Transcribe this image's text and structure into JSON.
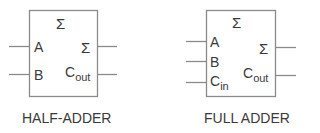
{
  "diagram": {
    "colors": {
      "stroke": "#888888",
      "text": "#3a3a3a",
      "background": "#ffffff"
    },
    "half_adder": {
      "top_symbol": "Σ",
      "inputs": [
        {
          "label": "A",
          "sub": ""
        },
        {
          "label": "B",
          "sub": ""
        }
      ],
      "outputs": [
        {
          "label": "Σ",
          "sub": ""
        },
        {
          "label": "C",
          "sub": "out"
        }
      ],
      "caption": "HALF-ADDER"
    },
    "full_adder": {
      "top_symbol": "Σ",
      "inputs": [
        {
          "label": "A",
          "sub": ""
        },
        {
          "label": "B",
          "sub": ""
        },
        {
          "label": "C",
          "sub": "in"
        }
      ],
      "outputs": [
        {
          "label": "Σ",
          "sub": ""
        },
        {
          "label": "C",
          "sub": "out"
        }
      ],
      "caption": "FULL ADDER"
    }
  }
}
